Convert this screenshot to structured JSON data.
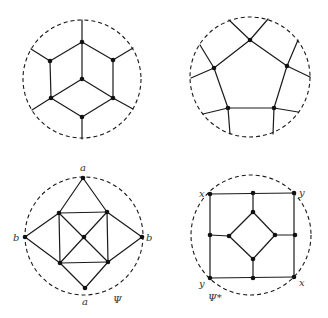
{
  "figure": {
    "width": 328,
    "height": 318,
    "colors": {
      "line": "#1a1a1a",
      "node": "#111111",
      "label": "#333333",
      "background": "#ffffff"
    },
    "panels": [
      {
        "id": "hexagonal-cube-graph",
        "circle": {
          "cx": 82,
          "cy": 79,
          "r": 59
        },
        "nodes": [
          [
            82,
            42
          ],
          [
            50,
            61
          ],
          [
            113,
            60
          ],
          [
            82,
            79
          ],
          [
            51,
            98
          ],
          [
            113,
            98
          ],
          [
            82,
            117
          ]
        ],
        "edges": [
          [
            [
              82,
              42
            ],
            [
              50,
              61
            ]
          ],
          [
            [
              82,
              42
            ],
            [
              113,
              60
            ]
          ],
          [
            [
              82,
              42
            ],
            [
              82,
              79
            ]
          ],
          [
            [
              50,
              61
            ],
            [
              51,
              98
            ]
          ],
          [
            [
              113,
              60
            ],
            [
              113,
              98
            ]
          ],
          [
            [
              82,
              79
            ],
            [
              51,
              98
            ]
          ],
          [
            [
              82,
              79
            ],
            [
              113,
              98
            ]
          ],
          [
            [
              51,
              98
            ],
            [
              82,
              117
            ]
          ],
          [
            [
              113,
              98
            ],
            [
              82,
              117
            ]
          ],
          [
            [
              82,
              42
            ],
            [
              82,
              20
            ]
          ],
          [
            [
              50,
              61
            ],
            [
              31,
              49
            ]
          ],
          [
            [
              113,
              60
            ],
            [
              133,
              48
            ]
          ],
          [
            [
              51,
              98
            ],
            [
              32,
              110
            ]
          ],
          [
            [
              113,
              98
            ],
            [
              133,
              109
            ]
          ],
          [
            [
              82,
              117
            ],
            [
              82,
              139
            ]
          ]
        ],
        "labels": []
      },
      {
        "id": "pentagon-graph",
        "circle": {
          "cx": 250,
          "cy": 77,
          "r": 60
        },
        "nodes": [
          [
            250,
            40
          ],
          [
            214,
            68
          ],
          [
            287,
            66
          ],
          [
            228,
            108
          ],
          [
            274,
            108
          ]
        ],
        "edges": [
          [
            [
              250,
              40
            ],
            [
              214,
              68
            ]
          ],
          [
            [
              250,
              40
            ],
            [
              287,
              66
            ]
          ],
          [
            [
              214,
              68
            ],
            [
              228,
              108
            ]
          ],
          [
            [
              287,
              66
            ],
            [
              274,
              108
            ]
          ],
          [
            [
              228,
              108
            ],
            [
              274,
              108
            ]
          ],
          [
            [
              250,
              40
            ],
            [
              229,
              20
            ]
          ],
          [
            [
              250,
              40
            ],
            [
              268,
              19
            ]
          ],
          [
            [
              214,
              68
            ],
            [
              200,
              45
            ]
          ],
          [
            [
              214,
              68
            ],
            [
              191,
              78
            ]
          ],
          [
            [
              287,
              66
            ],
            [
              298,
              40
            ]
          ],
          [
            [
              287,
              66
            ],
            [
              310,
              77
            ]
          ],
          [
            [
              228,
              108
            ],
            [
              203,
              114
            ]
          ],
          [
            [
              228,
              108
            ],
            [
              230,
              134
            ]
          ],
          [
            [
              274,
              108
            ],
            [
              298,
              112
            ]
          ],
          [
            [
              274,
              108
            ],
            [
              273,
              134
            ]
          ]
        ],
        "labels": []
      },
      {
        "id": "psi-graph",
        "circle": {
          "cx": 84,
          "cy": 236,
          "r": 59
        },
        "nodes": [
          [
            83,
            178
          ],
          [
            25,
            237
          ],
          [
            142,
            237
          ],
          [
            85,
            288
          ],
          [
            59,
            213
          ],
          [
            107,
            212
          ],
          [
            60,
            263
          ],
          [
            108,
            262
          ],
          [
            84,
            237
          ]
        ],
        "edges": [
          [
            [
              83,
              178
            ],
            [
              59,
              213
            ]
          ],
          [
            [
              83,
              178
            ],
            [
              107,
              212
            ]
          ],
          [
            [
              25,
              237
            ],
            [
              59,
              213
            ]
          ],
          [
            [
              25,
              237
            ],
            [
              60,
              263
            ]
          ],
          [
            [
              142,
              237
            ],
            [
              107,
              212
            ]
          ],
          [
            [
              142,
              237
            ],
            [
              108,
              262
            ]
          ],
          [
            [
              85,
              288
            ],
            [
              60,
              263
            ]
          ],
          [
            [
              85,
              288
            ],
            [
              108,
              262
            ]
          ],
          [
            [
              59,
              213
            ],
            [
              107,
              212
            ]
          ],
          [
            [
              107,
              212
            ],
            [
              108,
              262
            ]
          ],
          [
            [
              108,
              262
            ],
            [
              60,
              263
            ]
          ],
          [
            [
              60,
              263
            ],
            [
              59,
              213
            ]
          ],
          [
            [
              59,
              213
            ],
            [
              108,
              262
            ]
          ],
          [
            [
              107,
              212
            ],
            [
              60,
              263
            ]
          ]
        ],
        "labels": [
          {
            "text": "a",
            "x": 80,
            "y": 171
          },
          {
            "text": "a",
            "x": 82,
            "y": 305
          },
          {
            "text": "b",
            "x": 13,
            "y": 241
          },
          {
            "text": "b",
            "x": 146,
            "y": 241
          },
          {
            "text": "Ψ",
            "x": 113,
            "y": 303
          }
        ]
      },
      {
        "id": "psi-star-graph",
        "circle": {
          "cx": 251,
          "cy": 235,
          "r": 60
        },
        "nodes": [
          [
            210,
            194
          ],
          [
            253,
            193
          ],
          [
            294,
            193
          ],
          [
            210,
            235
          ],
          [
            295,
            235
          ],
          [
            210,
            278
          ],
          [
            253,
            278
          ],
          [
            294,
            277
          ],
          [
            253,
            212
          ],
          [
            229,
            236
          ],
          [
            275,
            235
          ],
          [
            253,
            259
          ]
        ],
        "edges": [
          [
            [
              210,
              194
            ],
            [
              294,
              193
            ]
          ],
          [
            [
              294,
              193
            ],
            [
              294,
              277
            ]
          ],
          [
            [
              294,
              277
            ],
            [
              210,
              278
            ]
          ],
          [
            [
              210,
              278
            ],
            [
              210,
              194
            ]
          ],
          [
            [
              253,
              193
            ],
            [
              253,
              212
            ]
          ],
          [
            [
              210,
              235
            ],
            [
              229,
              236
            ]
          ],
          [
            [
              295,
              235
            ],
            [
              275,
              235
            ]
          ],
          [
            [
              253,
              278
            ],
            [
              253,
              259
            ]
          ],
          [
            [
              253,
              212
            ],
            [
              229,
              236
            ]
          ],
          [
            [
              229,
              236
            ],
            [
              253,
              259
            ]
          ],
          [
            [
              253,
              259
            ],
            [
              275,
              235
            ]
          ],
          [
            [
              275,
              235
            ],
            [
              253,
              212
            ]
          ]
        ],
        "labels": [
          {
            "text": "x",
            "x": 199,
            "y": 197
          },
          {
            "text": "y",
            "x": 299,
            "y": 196
          },
          {
            "text": "y",
            "x": 199,
            "y": 287
          },
          {
            "text": "x",
            "x": 299,
            "y": 286
          },
          {
            "text": "Ψ*",
            "x": 208,
            "y": 301
          }
        ]
      }
    ]
  }
}
